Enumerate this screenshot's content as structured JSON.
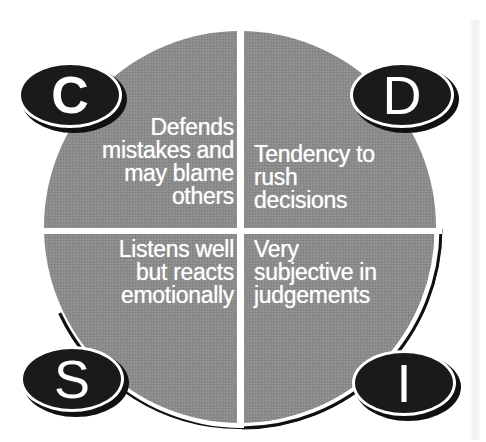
{
  "diagram": {
    "type": "DISC quadrant circle",
    "colors": {
      "disc_fill": "#8a8a8a",
      "divider": "#ffffff",
      "badge_fill": "#1a1a1a",
      "text": "#ffffff",
      "outline": "#111111"
    },
    "quadrants": [
      {
        "id": "C",
        "position": "top-left",
        "badge_letter": "C",
        "lines": [
          "Defends",
          "mistakes and",
          "may blame",
          "others"
        ]
      },
      {
        "id": "D",
        "position": "top-right",
        "badge_letter": "D",
        "lines": [
          "Tendency to",
          "rush",
          "decisions"
        ]
      },
      {
        "id": "S",
        "position": "bottom-left",
        "badge_letter": "S",
        "lines": [
          "Listens well",
          "but reacts",
          "emotionally"
        ]
      },
      {
        "id": "I",
        "position": "bottom-right",
        "badge_letter": "I",
        "lines": [
          "Very",
          "subjective in",
          "judgements"
        ]
      }
    ]
  }
}
